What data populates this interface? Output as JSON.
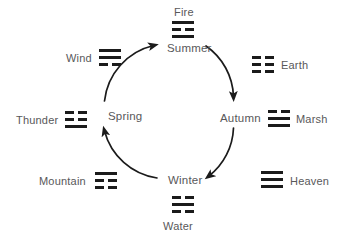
{
  "diagram": {
    "stroke_color": "#1b1b1b",
    "text_color": "#58585a",
    "background": "#ffffff",
    "cycle_direction": "clockwise"
  },
  "seasons": [
    {
      "id": "spring",
      "label": "Spring",
      "x": 108,
      "y": 110,
      "angle_deg": 180
    },
    {
      "id": "summer",
      "label": "Summer",
      "x": 167,
      "y": 42,
      "angle_deg": 270
    },
    {
      "id": "autumn",
      "label": "Autumn",
      "x": 220,
      "y": 112,
      "angle_deg": 0
    },
    {
      "id": "winter",
      "label": "Winter",
      "x": 168,
      "y": 174,
      "angle_deg": 90
    }
  ],
  "cycle_arrows": [
    {
      "from": "spring",
      "to": "summer"
    },
    {
      "from": "summer",
      "to": "autumn"
    },
    {
      "from": "autumn",
      "to": "winter"
    },
    {
      "from": "winter",
      "to": "spring"
    }
  ],
  "trigrams": [
    {
      "id": "fire",
      "label": "Fire",
      "lines": [
        "solid",
        "broken",
        "solid"
      ],
      "label_x": 174,
      "label_y": 6,
      "glyph_x": 172,
      "glyph_y": 21,
      "label_position": "above"
    },
    {
      "id": "earth",
      "label": "Earth",
      "lines": [
        "broken",
        "broken",
        "broken"
      ],
      "label_x": 281,
      "label_y": 59,
      "glyph_x": 252,
      "glyph_y": 56,
      "label_position": "right"
    },
    {
      "id": "marsh",
      "label": "Marsh",
      "lines": [
        "broken",
        "solid",
        "solid"
      ],
      "label_x": 296,
      "label_y": 113,
      "glyph_x": 268,
      "glyph_y": 110,
      "label_position": "right"
    },
    {
      "id": "heaven",
      "label": "Heaven",
      "lines": [
        "solid",
        "solid",
        "solid"
      ],
      "label_x": 290,
      "label_y": 175,
      "glyph_x": 261,
      "glyph_y": 171,
      "label_position": "right"
    },
    {
      "id": "water",
      "label": "Water",
      "lines": [
        "broken",
        "solid",
        "broken"
      ],
      "label_x": 163,
      "label_y": 220,
      "glyph_x": 172,
      "glyph_y": 196,
      "label_position": "below"
    },
    {
      "id": "mountain",
      "label": "Mountain",
      "lines": [
        "solid",
        "broken",
        "broken"
      ],
      "label_x": 39,
      "label_y": 175,
      "glyph_x": 95,
      "glyph_y": 172,
      "label_position": "left"
    },
    {
      "id": "thunder",
      "label": "Thunder",
      "lines": [
        "broken",
        "broken",
        "solid"
      ],
      "label_x": 16,
      "label_y": 114,
      "glyph_x": 65,
      "glyph_y": 111,
      "label_position": "left"
    },
    {
      "id": "wind",
      "label": "Wind",
      "lines": [
        "solid",
        "solid",
        "broken"
      ],
      "label_x": 66,
      "label_y": 52,
      "glyph_x": 99,
      "glyph_y": 49,
      "label_position": "left"
    }
  ]
}
